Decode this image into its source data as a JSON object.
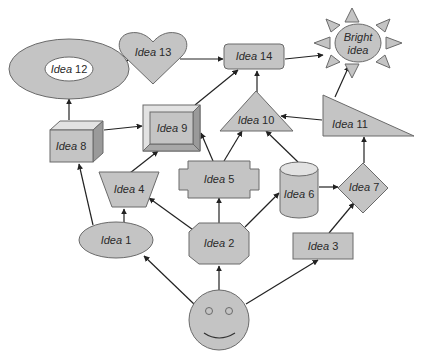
{
  "diagram": {
    "type": "idea-flow-map",
    "colors": {
      "shape_fill": "#c4c4c4",
      "shape_stroke": "#6a6a6a",
      "arrow": "#222222",
      "background": "#ffffff"
    },
    "nodes": [
      {
        "id": "start",
        "label": "",
        "shape": "smiley-face"
      },
      {
        "id": "idea1",
        "word": "Idea",
        "num": "1",
        "shape": "ellipse"
      },
      {
        "id": "idea2",
        "word": "Idea",
        "num": "2",
        "shape": "octagon"
      },
      {
        "id": "idea3",
        "word": "Idea",
        "num": "3",
        "shape": "rectangle"
      },
      {
        "id": "idea4",
        "word": "Idea",
        "num": "4",
        "shape": "trapezoid"
      },
      {
        "id": "idea5",
        "word": "Idea",
        "num": "5",
        "shape": "plaque"
      },
      {
        "id": "idea6",
        "word": "Idea",
        "num": "6",
        "shape": "cylinder"
      },
      {
        "id": "idea7",
        "word": "Idea",
        "num": "7",
        "shape": "diamond"
      },
      {
        "id": "idea8",
        "word": "Idea",
        "num": "8",
        "shape": "cube"
      },
      {
        "id": "idea9",
        "word": "Idea",
        "num": "9",
        "shape": "bevel"
      },
      {
        "id": "idea10",
        "word": "Idea",
        "num": "10",
        "shape": "triangle"
      },
      {
        "id": "idea11",
        "word": "Idea",
        "num": "11",
        "shape": "right-triangle"
      },
      {
        "id": "idea12",
        "word": "Idea",
        "num": "12",
        "shape": "donut"
      },
      {
        "id": "idea13",
        "word": "Idea",
        "num": "13",
        "shape": "heart"
      },
      {
        "id": "idea14",
        "word": "Idea",
        "num": "14",
        "shape": "rounded-rectangle"
      },
      {
        "id": "bright",
        "line1": "Bright",
        "line2": "idea",
        "shape": "sun"
      }
    ],
    "edges": [
      {
        "from": "start",
        "to": "idea1"
      },
      {
        "from": "start",
        "to": "idea2"
      },
      {
        "from": "start",
        "to": "idea3"
      },
      {
        "from": "idea1",
        "to": "idea4"
      },
      {
        "from": "idea1",
        "to": "idea8"
      },
      {
        "from": "idea2",
        "to": "idea4"
      },
      {
        "from": "idea2",
        "to": "idea5"
      },
      {
        "from": "idea2",
        "to": "idea6"
      },
      {
        "from": "idea3",
        "to": "idea7"
      },
      {
        "from": "idea4",
        "to": "idea9"
      },
      {
        "from": "idea5",
        "to": "idea9"
      },
      {
        "from": "idea5",
        "to": "idea10"
      },
      {
        "from": "idea6",
        "to": "idea7"
      },
      {
        "from": "idea6",
        "to": "idea10"
      },
      {
        "from": "idea7",
        "to": "idea11"
      },
      {
        "from": "idea8",
        "to": "idea12"
      },
      {
        "from": "idea8",
        "to": "idea9"
      },
      {
        "from": "idea9",
        "to": "idea14"
      },
      {
        "from": "idea10",
        "to": "idea14"
      },
      {
        "from": "idea11",
        "to": "idea10"
      },
      {
        "from": "idea11",
        "to": "bright"
      },
      {
        "from": "idea12",
        "to": "idea13"
      },
      {
        "from": "idea13",
        "to": "idea14"
      },
      {
        "from": "idea14",
        "to": "bright"
      }
    ]
  }
}
